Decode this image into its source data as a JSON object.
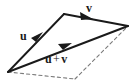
{
  "figure": {
    "kind": "vector-addition-parallelogram",
    "background_color": "#ffffff",
    "stroke_color": "#1a1a1a",
    "dashed_color": "#6e6e6e",
    "labels": {
      "u": "u",
      "v": "v",
      "sum_left": "u",
      "sum_operator": "+",
      "sum_right": "v"
    },
    "geometry": {
      "origin": [
        8,
        72
      ],
      "u_tip": [
        64,
        14
      ],
      "v_tip": [
        128,
        26
      ],
      "parallel_vertex": [
        75,
        79
      ],
      "arrowhead_u": [
        38,
        38
      ],
      "arrowhead_v": [
        88,
        16
      ],
      "arrowhead_sum": [
        66,
        46
      ]
    }
  }
}
